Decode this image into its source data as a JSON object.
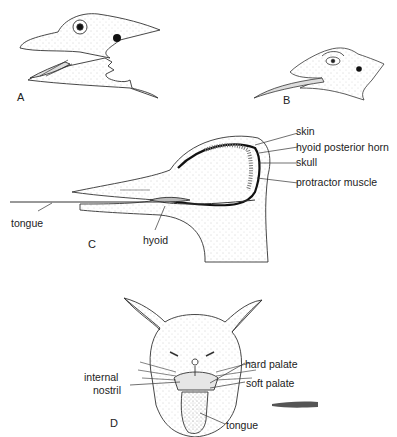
{
  "figure": {
    "panels": [
      {
        "id": "A",
        "letter": "A",
        "subject": "bird head with tongue retracted"
      },
      {
        "id": "B",
        "letter": "B",
        "subject": "bird head with long tongue extended"
      },
      {
        "id": "C",
        "letter": "C",
        "subject": "woodpecker head cross-section"
      },
      {
        "id": "D",
        "letter": "D",
        "subject": "cat face with mouth open"
      }
    ],
    "panel_c_labels": {
      "skin": "skin",
      "hyoid_horn": "hyoid posterior horn",
      "skull": "skull",
      "protractor": "protractor muscle",
      "tongue": "tongue",
      "hyoid": "hyoid"
    },
    "panel_d_labels": {
      "hard_palate": "hard palate",
      "internal_nostril_line1": "internal",
      "internal_nostril_line2": "nostril",
      "soft_palate": "soft palate",
      "tongue": "tongue"
    },
    "colors": {
      "ink": "#222222",
      "stipple": "#9a9a9a",
      "background": "#ffffff"
    }
  }
}
